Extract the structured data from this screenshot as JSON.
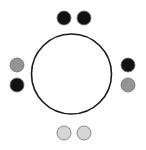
{
  "canvas": {
    "width": 146,
    "height": 150,
    "background_color": "#ffffff",
    "title": "Circle with eight perimeter dots"
  },
  "main_circle": {
    "name": "main-circle",
    "center_x": 71.5,
    "center_y": 74,
    "radius": 40,
    "stroke_color": "#1a1a1a",
    "stroke_width": 1.6,
    "fill_color": "#ffffff"
  },
  "legend": {
    "colors": {
      "black": "#121212",
      "medium_gray": "#949494",
      "light_gray": "#d6d6d6"
    },
    "dot_outline_color": "#6e6e6e",
    "dot_outline_width": 0.8
  },
  "dots": [
    {
      "id": "dot-top-left",
      "label": "top-left dot",
      "cx": 64,
      "cy": 18,
      "r": 7.0,
      "color": "#121212",
      "tone": "black"
    },
    {
      "id": "dot-top-right",
      "label": "top-right dot",
      "cx": 84,
      "cy": 18,
      "r": 7.0,
      "color": "#121212",
      "tone": "black"
    },
    {
      "id": "dot-right-upper",
      "label": "right-upper dot",
      "cx": 128,
      "cy": 65,
      "r": 7.0,
      "color": "#121212",
      "tone": "black"
    },
    {
      "id": "dot-right-lower",
      "label": "right-lower dot",
      "cx": 128,
      "cy": 85,
      "r": 7.0,
      "color": "#949494",
      "tone": "medium-gray"
    },
    {
      "id": "dot-bottom-right",
      "label": "bottom-right dot",
      "cx": 84,
      "cy": 133,
      "r": 7.0,
      "color": "#d6d6d6",
      "tone": "light-gray"
    },
    {
      "id": "dot-bottom-left",
      "label": "bottom-left dot",
      "cx": 64,
      "cy": 133,
      "r": 7.0,
      "color": "#d6d6d6",
      "tone": "light-gray"
    },
    {
      "id": "dot-left-lower",
      "label": "left-lower dot",
      "cx": 17,
      "cy": 85,
      "r": 7.0,
      "color": "#121212",
      "tone": "black"
    },
    {
      "id": "dot-left-upper",
      "label": "left-upper dot",
      "cx": 17,
      "cy": 65,
      "r": 7.0,
      "color": "#949494",
      "tone": "medium-gray"
    }
  ]
}
